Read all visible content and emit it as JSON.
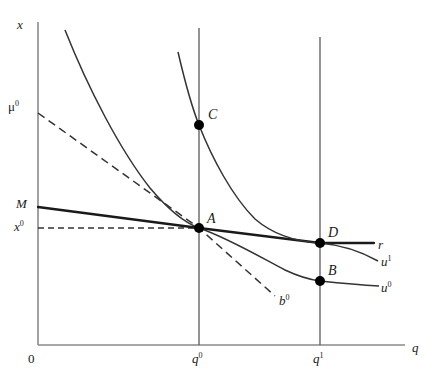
{
  "figure": {
    "type": "economics-indifference-curve-diagram",
    "background_color": "#ffffff",
    "line_color": "#333333",
    "axis_color": "#8a8a8a",
    "point_color": "#000000"
  },
  "axes": {
    "y_label": "x",
    "x_label": "q",
    "origin_label": "0",
    "x_axis": {
      "x_start": 38,
      "x_end": 405,
      "y": 345
    },
    "y_axis": {
      "y_start": 22,
      "y_end": 345,
      "x": 38
    }
  },
  "ticks": {
    "x": [
      {
        "label": "q",
        "sup": "0",
        "px": 199
      },
      {
        "label": "q",
        "sup": "1",
        "px": 320
      }
    ],
    "y": [
      {
        "label": "μ",
        "sup": "0",
        "px": 113
      },
      {
        "label": "M",
        "sup": "",
        "px": 207
      },
      {
        "label": "x",
        "sup": "0",
        "px": 228
      }
    ]
  },
  "points": [
    {
      "name": "A",
      "label": "A",
      "x": 199,
      "y": 228,
      "label_dx": 8,
      "label_dy": -16
    },
    {
      "name": "B",
      "label": "B",
      "x": 320,
      "y": 281,
      "label_dx": 8,
      "label_dy": -17
    },
    {
      "name": "C",
      "label": "C",
      "x": 199,
      "y": 125,
      "label_dx": 9,
      "label_dy": -17
    },
    {
      "name": "D",
      "label": "D",
      "x": 320,
      "y": 243,
      "label_dx": 8,
      "label_dy": -17
    }
  ],
  "curves": [
    {
      "name": "u0",
      "label": "u",
      "sup": "0",
      "label_x": 384,
      "label_y": 281,
      "style": "solid"
    },
    {
      "name": "u1",
      "label": "u",
      "sup": "1",
      "label_x": 385,
      "label_y": 255,
      "style": "solid"
    },
    {
      "name": "r",
      "label": "r",
      "sup": "",
      "label_x": 380,
      "label_y": 237,
      "style": "solid"
    },
    {
      "name": "b0",
      "label": "b",
      "sup": "0",
      "label_x": 280,
      "label_y": 294,
      "style": "dashed"
    }
  ],
  "guides": [
    {
      "name": "x0-horizontal-dashed",
      "style": "dashed"
    }
  ]
}
